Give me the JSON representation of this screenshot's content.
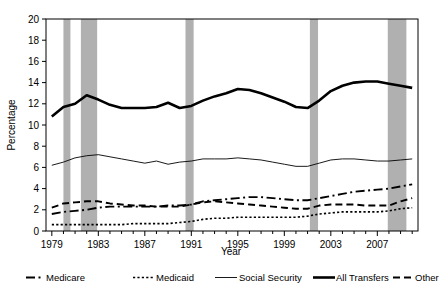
{
  "chart_data": {
    "type": "line",
    "title": "",
    "xlabel": "Year",
    "ylabel": "Percentage",
    "xlim": [
      1978.5,
      2010.5
    ],
    "ylim": [
      0,
      20
    ],
    "yticks": [
      0,
      2,
      4,
      6,
      8,
      10,
      12,
      14,
      16,
      18,
      20
    ],
    "ytick_labels": [
      "0",
      "2",
      "4",
      "6",
      "8",
      "10",
      "12",
      "14",
      "16",
      "18",
      "20"
    ],
    "xticks": [
      1979,
      1983,
      1987,
      1991,
      1995,
      1999,
      2003,
      2007
    ],
    "xtick_labels": [
      "1979",
      "1983",
      "1987",
      "1991",
      "1995",
      "1999",
      "2003",
      "2007"
    ],
    "xtick_minor_step": 1,
    "grid": false,
    "legend_position": "below",
    "x": [
      1979,
      1980,
      1981,
      1982,
      1983,
      1984,
      1985,
      1986,
      1987,
      1988,
      1989,
      1990,
      1991,
      1992,
      1993,
      1994,
      1995,
      1996,
      1997,
      1998,
      1999,
      2000,
      2001,
      2002,
      2003,
      2004,
      2005,
      2006,
      2007,
      2008,
      2009,
      2010
    ],
    "series": [
      {
        "name": "All Transfers",
        "style": "solid-thick",
        "color": "#000000",
        "linewidth": 2.6,
        "values": [
          10.8,
          11.7,
          12.0,
          12.8,
          12.4,
          11.9,
          11.6,
          11.6,
          11.6,
          11.7,
          12.1,
          11.6,
          11.8,
          12.3,
          12.7,
          13.0,
          13.4,
          13.3,
          13.0,
          12.6,
          12.2,
          11.7,
          11.6,
          12.3,
          13.2,
          13.7,
          14.0,
          14.1,
          14.1,
          13.9,
          13.7,
          13.5
        ]
      },
      {
        "name": "Social Security",
        "style": "solid-thin",
        "color": "#000000",
        "linewidth": 0.9,
        "values": [
          6.2,
          6.5,
          6.9,
          7.1,
          7.2,
          7.0,
          6.8,
          6.6,
          6.4,
          6.6,
          6.3,
          6.5,
          6.6,
          6.8,
          6.8,
          6.8,
          6.9,
          6.8,
          6.7,
          6.5,
          6.3,
          6.1,
          6.1,
          6.4,
          6.7,
          6.8,
          6.8,
          6.7,
          6.6,
          6.6,
          6.7,
          6.8
        ]
      },
      {
        "name": "Medicare",
        "style": "dash-dot",
        "color": "#000000",
        "linewidth": 1.9,
        "values": [
          1.6,
          1.8,
          1.9,
          2.0,
          2.2,
          2.3,
          2.3,
          2.3,
          2.3,
          2.3,
          2.4,
          2.4,
          2.5,
          2.8,
          2.9,
          3.0,
          3.1,
          3.2,
          3.2,
          3.1,
          3.0,
          2.9,
          2.9,
          3.1,
          3.3,
          3.5,
          3.7,
          3.8,
          3.9,
          4.0,
          4.2,
          4.4
        ]
      },
      {
        "name": "Other",
        "style": "dashed",
        "color": "#000000",
        "linewidth": 1.9,
        "values": [
          2.2,
          2.6,
          2.7,
          2.8,
          2.8,
          2.6,
          2.5,
          2.4,
          2.4,
          2.3,
          2.3,
          2.3,
          2.5,
          2.7,
          2.8,
          2.7,
          2.6,
          2.5,
          2.4,
          2.3,
          2.2,
          2.1,
          2.1,
          2.4,
          2.5,
          2.5,
          2.5,
          2.4,
          2.4,
          2.4,
          2.8,
          3.1
        ]
      },
      {
        "name": "Medicaid",
        "style": "dotted",
        "color": "#000000",
        "linewidth": 1.6,
        "values": [
          0.6,
          0.6,
          0.6,
          0.6,
          0.6,
          0.6,
          0.6,
          0.7,
          0.7,
          0.7,
          0.7,
          0.8,
          0.9,
          1.1,
          1.2,
          1.2,
          1.3,
          1.3,
          1.3,
          1.3,
          1.3,
          1.3,
          1.4,
          1.6,
          1.7,
          1.8,
          1.8,
          1.8,
          1.8,
          1.9,
          2.1,
          2.2
        ]
      }
    ],
    "shaded_bands": [
      {
        "label": "recession-1980",
        "start": 1980.0,
        "end": 1980.6
      },
      {
        "label": "recession-1981-1982",
        "start": 1981.5,
        "end": 1982.9
      },
      {
        "label": "recession-1990-1991",
        "start": 1990.5,
        "end": 1991.2
      },
      {
        "label": "recession-2001",
        "start": 2001.2,
        "end": 2001.9
      },
      {
        "label": "recession-2007-2009",
        "start": 2007.9,
        "end": 2009.5
      }
    ],
    "shaded_band_color": "#b0b0b0"
  },
  "legend": {
    "items": [
      {
        "label": "Medicare",
        "style": "dash-dot"
      },
      {
        "label": "Medicaid",
        "style": "dotted"
      },
      {
        "label": "Social Security",
        "style": "solid-thin"
      },
      {
        "label": "All Transfers",
        "style": "solid-thick"
      },
      {
        "label": "Other",
        "style": "dashed"
      }
    ]
  }
}
